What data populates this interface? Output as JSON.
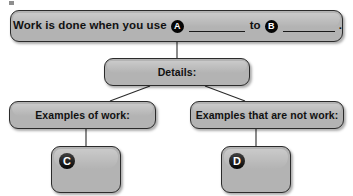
{
  "worksheet": {
    "banner": {
      "text_before_a": "Work is done when you use",
      "badge_a": "A",
      "blank_a": "",
      "text_between": "to",
      "badge_b": "B",
      "blank_b": "",
      "end_punctuation": "."
    },
    "details": {
      "label": "Details:"
    },
    "branches": [
      {
        "label": "Examples of work:",
        "answer_badge": "C",
        "answer_text": ""
      },
      {
        "label": "Examples that are not work:",
        "answer_badge": "D",
        "answer_text": ""
      }
    ]
  },
  "style": {
    "box_fill": "#b3b3b3",
    "box_border": "#2b2b2b",
    "badge_fill": "#050505",
    "badge_text": "#ffffff",
    "page_background": "#ffffff",
    "connector_color": "#2b2b2b"
  }
}
